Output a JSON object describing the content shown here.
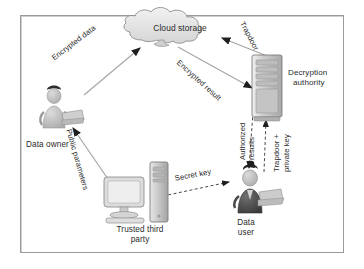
{
  "figure": {
    "type": "architecture-flow-diagram",
    "title": "",
    "border_color": "#9a9a9a",
    "background": "#ffffff",
    "text_color": "#2b2b2b",
    "palette": {
      "cloud_fill": "#e3e3e3",
      "cloud_stroke": "#8d8d8d",
      "server_fill": "#c9c9c9",
      "server_stroke": "#7d7d7d",
      "person_light": "#c4c4c4",
      "person_dark": "#4f4f4f",
      "monitor_fill": "#dcdcdc",
      "arrow_solid": "#9b9b9b",
      "arrow_dashed": "#6f6f6f"
    }
  },
  "nodes": [
    {
      "id": "cloud-storage",
      "label": "Cloud storage",
      "icon": "cloud-icon"
    },
    {
      "id": "decryption-authority",
      "label": "Decryption\nauthority",
      "label_line1": "Decryption",
      "label_line2": "authority",
      "icon": "server-rack-icon"
    },
    {
      "id": "data-owner",
      "label": "Data owner",
      "icon": "person-with-laptop-icon"
    },
    {
      "id": "trusted-third-party",
      "label": "Trusted third\nparty",
      "label_line1": "Trusted third",
      "label_line2": "party",
      "icon": "desktop-computer-icon"
    },
    {
      "id": "data-user",
      "label": "Data\nuser",
      "label_line1": "Data",
      "label_line2": "user",
      "icon": "person-with-laptop-icon"
    }
  ],
  "edges": [
    {
      "id": "owner-to-cloud",
      "label": "Encrypted data",
      "from": "data-owner",
      "to": "cloud-storage",
      "style": "solid"
    },
    {
      "id": "authority-to-cloud",
      "label": "Trapdoor",
      "from": "decryption-authority",
      "to": "cloud-storage",
      "style": "solid"
    },
    {
      "id": "cloud-to-authority",
      "label": "Encrypted result",
      "from": "cloud-storage",
      "to": "decryption-authority",
      "style": "solid"
    },
    {
      "id": "ttp-to-owner",
      "label": "Public parameters",
      "from": "trusted-third-party",
      "to": "data-owner",
      "style": "solid"
    },
    {
      "id": "ttp-to-user",
      "label": "Secret key",
      "from": "trusted-third-party",
      "to": "data-user",
      "style": "dashed"
    },
    {
      "id": "authority-to-user",
      "label": "Authorized results",
      "from": "decryption-authority",
      "to": "data-user",
      "style": "dashed"
    },
    {
      "id": "user-to-authority",
      "label": "Trapdoor + private key",
      "from": "data-user",
      "to": "decryption-authority",
      "style": "dashed"
    }
  ],
  "labels": {
    "cloud_storage": "Cloud storage",
    "decryption_authority_l1": "Decryption",
    "decryption_authority_l2": "authority",
    "data_owner": "Data owner",
    "trusted_third_party_l1": "Trusted third",
    "trusted_third_party_l2": "party",
    "data_user_l1": "Data",
    "data_user_l2": "user",
    "encrypted_data": "Encrypted data",
    "trapdoor": "Trapdoor",
    "encrypted_result": "Encrypted result",
    "public_parameters": "Public parameters",
    "secret_key": "Secret key",
    "authorized_results": "Authorized results",
    "trapdoor_private_key": "Trapdoor + private key"
  }
}
